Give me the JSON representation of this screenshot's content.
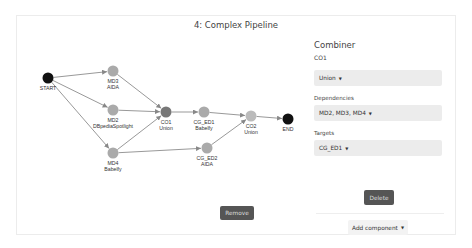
{
  "page": {
    "title": "4: Complex Pipeline"
  },
  "graph": {
    "nodes": [
      {
        "id": "START",
        "label": "START",
        "sublabel": "",
        "x": 48,
        "y": 78,
        "color": "#111111"
      },
      {
        "id": "MD3",
        "label": "MD3",
        "sublabel": "AIDA",
        "x": 113,
        "y": 71,
        "color": "#aaaaaa"
      },
      {
        "id": "MD2",
        "label": "MD2",
        "sublabel": "DBpediaSpotlight",
        "x": 113,
        "y": 110,
        "color": "#aaaaaa"
      },
      {
        "id": "MD4",
        "label": "MD4",
        "sublabel": "Babelfy",
        "x": 113,
        "y": 153,
        "color": "#aaaaaa"
      },
      {
        "id": "CO1",
        "label": "CO1",
        "sublabel": "Union",
        "x": 166,
        "y": 112,
        "color": "#777777"
      },
      {
        "id": "CG_ED1",
        "label": "CG_ED1",
        "sublabel": "Babelfy",
        "x": 204,
        "y": 112,
        "color": "#aaaaaa"
      },
      {
        "id": "CG_ED2",
        "label": "CG_ED2",
        "sublabel": "AIDA",
        "x": 207,
        "y": 148,
        "color": "#aaaaaa"
      },
      {
        "id": "CO2",
        "label": "CO2",
        "sublabel": "Union",
        "x": 251,
        "y": 116,
        "color": "#bbbbbb"
      },
      {
        "id": "END",
        "label": "END",
        "sublabel": "",
        "x": 288,
        "y": 119,
        "color": "#111111"
      }
    ],
    "edges": [
      [
        "START",
        "MD3"
      ],
      [
        "START",
        "MD2"
      ],
      [
        "START",
        "MD4"
      ],
      [
        "MD3",
        "CO1"
      ],
      [
        "MD2",
        "CO1"
      ],
      [
        "MD4",
        "CO1"
      ],
      [
        "MD4",
        "CG_ED2"
      ],
      [
        "CO1",
        "CG_ED1"
      ],
      [
        "CG_ED1",
        "CO2"
      ],
      [
        "CG_ED2",
        "CO2"
      ],
      [
        "CO2",
        "END"
      ]
    ]
  },
  "panel": {
    "title": "Combiner",
    "component_id": "CO1",
    "type_value": "Union",
    "dependencies_label": "Dependencies",
    "dependencies_value": "MD2, MD3, MD4",
    "targets_label": "Targets",
    "targets_value": "CG_ED1",
    "delete_label": "Delete",
    "add_component_label": "Add component"
  },
  "remove_label": "Remove",
  "caret": "▼"
}
